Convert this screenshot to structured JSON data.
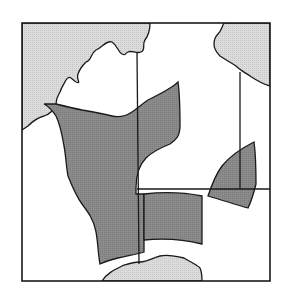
{
  "diagram": {
    "type": "schematic map",
    "colors": {
      "background": "#ffffff",
      "land": "#d9d9d9",
      "highlight": "#8a8a8a",
      "stroke": "#1a1a1a"
    },
    "regions": [
      {
        "name": "land-top-left",
        "kind": "land"
      },
      {
        "name": "land-top-center",
        "kind": "land"
      },
      {
        "name": "land-top-right",
        "kind": "land"
      },
      {
        "name": "land-bottom",
        "kind": "land"
      },
      {
        "name": "highlight-main-area",
        "kind": "highlight"
      },
      {
        "name": "highlight-lower-block",
        "kind": "highlight"
      },
      {
        "name": "highlight-right-wedge",
        "kind": "highlight"
      }
    ],
    "lines": [
      {
        "name": "vertical-boundary-center",
        "x": 137
      },
      {
        "name": "horizontal-boundary-right",
        "y": 189
      },
      {
        "name": "vertical-boundary-right",
        "x": 240
      }
    ]
  }
}
